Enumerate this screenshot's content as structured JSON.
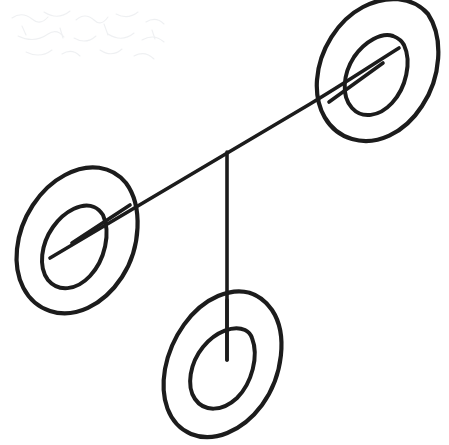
{
  "document": {
    "title": "Hand-drawn node diagram",
    "kind": "sketch",
    "description": "Three concentric-ellipse nodes joined by straight line segments forming a branching structure",
    "canvas": {
      "width": 449,
      "height": 445
    },
    "colors": {
      "background": "#ffffff",
      "ink": "#1c1c1c",
      "smudge": "#d9dde2"
    },
    "stroke": {
      "outer_ellipse_width": 4.2,
      "inner_ellipse_width": 4.0,
      "connector_width": 3.6
    }
  },
  "nodes": [
    {
      "id": "node-top-right",
      "label": "top-right-node",
      "center": {
        "x": 377,
        "y": 70
      },
      "outer": {
        "rx": 62,
        "ry": 78,
        "rotation": -28
      },
      "inner": {
        "rx": 33,
        "ry": 46,
        "rotation": -28
      },
      "stub": {
        "x1": 329,
        "y1": 102,
        "x2": 383,
        "y2": 63
      }
    },
    {
      "id": "node-left",
      "label": "left-node",
      "center": {
        "x": 77,
        "y": 240
      },
      "outer": {
        "rx": 62,
        "ry": 80,
        "rotation": -28
      },
      "inner": {
        "rx": 34,
        "ry": 48,
        "rotation": -28
      },
      "stub": {
        "x1": 130,
        "y1": 205,
        "x2": 72,
        "y2": 243
      }
    },
    {
      "id": "node-bottom",
      "label": "bottom-node",
      "center": {
        "x": 224,
        "y": 364
      },
      "outer": {
        "rx": 60,
        "ry": 77,
        "rotation": -22
      },
      "inner": {
        "rx": 32,
        "ry": 46,
        "rotation": -22
      },
      "stub": {
        "x1": 227,
        "y1": 300,
        "x2": 227,
        "y2": 360
      }
    }
  ],
  "edges": [
    {
      "id": "edge-diagonal",
      "label": "diagonal-connector",
      "from": "node-left",
      "to": "node-top-right",
      "x1": 50,
      "y1": 258,
      "x2": 399,
      "y2": 48
    },
    {
      "id": "edge-vertical",
      "label": "vertical-connector",
      "from": "junction",
      "to": "node-bottom",
      "x1": 227,
      "y1": 152,
      "x2": 227,
      "y2": 360
    }
  ],
  "junction": {
    "x": 227,
    "y": 152,
    "label": "branch-junction"
  },
  "artifacts": {
    "label": "scanner-smudge",
    "region": {
      "x": 4,
      "y": 4,
      "width": 190,
      "height": 62
    }
  }
}
